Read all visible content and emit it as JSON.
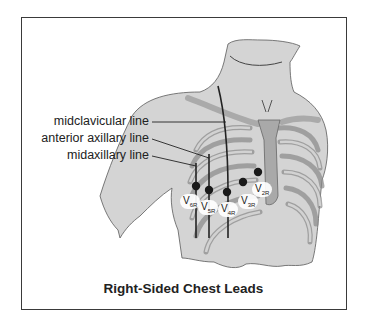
{
  "diagram": {
    "caption": "Right-Sided Chest Leads",
    "landmark_labels": [
      {
        "id": "midclavicular",
        "label": "midclavicular line"
      },
      {
        "id": "anterior-axillary",
        "label": "anterior axillary line"
      },
      {
        "id": "midaxillary",
        "label": "midaxillary line"
      }
    ],
    "leads": [
      {
        "id": "v6r",
        "main": "V",
        "sub": "6R"
      },
      {
        "id": "v5r",
        "main": "V",
        "sub": "5R"
      },
      {
        "id": "v4r",
        "main": "V",
        "sub": "4R"
      },
      {
        "id": "v3r",
        "main": "V",
        "sub": "3R"
      },
      {
        "id": "v2r",
        "main": "V",
        "sub": "2R"
      }
    ],
    "colors": {
      "skin": "#d4d4d4",
      "rib": "#bdbdbd",
      "outline": "#4a4a4a",
      "electrode": "#1a1a1a"
    }
  }
}
